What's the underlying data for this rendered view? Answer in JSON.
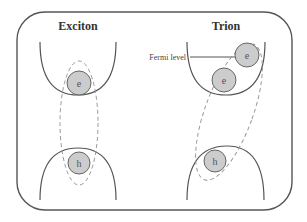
{
  "diagram": {
    "panels": [
      {
        "id": "exciton",
        "title": "Exciton",
        "particles": [
          {
            "label": "e",
            "type": "electron"
          },
          {
            "label": "h",
            "type": "hole"
          }
        ]
      },
      {
        "id": "trion",
        "title": "Trion",
        "annotation": "Fermi level",
        "particles": [
          {
            "label": "e",
            "type": "electron"
          },
          {
            "label": "e",
            "type": "electron"
          },
          {
            "label": "h",
            "type": "hole"
          }
        ]
      }
    ],
    "colors": {
      "frame": "#555555",
      "band": "#555555",
      "particle_fill": "#cccccc",
      "dashed_outline": "#999999"
    }
  }
}
